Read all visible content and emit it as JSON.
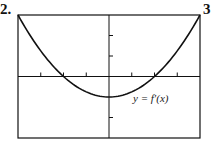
{
  "problem_number": "2.",
  "next_problem_number": "3",
  "chart_data": {
    "type": "line",
    "title": "",
    "xlabel": "",
    "ylabel": "",
    "annotation": "y = f′(x)",
    "xlim": [
      -4,
      4
    ],
    "ylim": [
      -3,
      3
    ],
    "grid": false,
    "x_ticks": [
      -3,
      -2,
      -1,
      1,
      2,
      3
    ],
    "y_ticks": [
      -2,
      1,
      2
    ],
    "series": [
      {
        "name": "y = f′(x)",
        "function": "x^2/4 - 1",
        "x": [
          -4,
          -3,
          -2,
          -1,
          0,
          1,
          2,
          3,
          4
        ],
        "y": [
          3,
          1.25,
          0,
          -0.75,
          -1,
          -0.75,
          0,
          1.25,
          3
        ]
      }
    ],
    "colors": {
      "curve": "#111111",
      "axes": "#111111"
    }
  }
}
